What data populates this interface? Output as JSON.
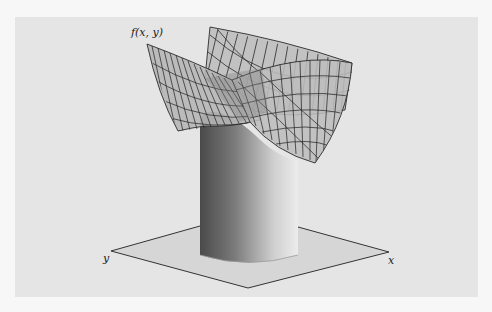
{
  "figure": {
    "function_label": "f(x, y)",
    "x_axis_label": "x",
    "y_axis_label": "y"
  },
  "colors": {
    "page_background": "#f7f7f7",
    "panel_background": "#e5e5e5",
    "plane_fill": "#d6d6d6",
    "surface_fill": "#b9b9b9",
    "wire_color": "#2a2a2a",
    "cylinder_dark": "#585858",
    "cylinder_light": "#e8e8e8"
  }
}
